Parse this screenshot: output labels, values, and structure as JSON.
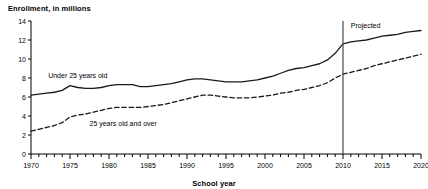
{
  "chart_data": {
    "type": "line",
    "title": "Enrollment, in millions",
    "xlabel": "School year",
    "ylabel": "",
    "xlim": [
      1970,
      2020
    ],
    "ylim": [
      0,
      14
    ],
    "yticks": [
      0,
      2,
      4,
      6,
      8,
      10,
      12,
      14
    ],
    "xticks_major": [
      1970,
      1975,
      1980,
      1985,
      1990,
      1995,
      2000,
      2005,
      2010,
      2015,
      2020
    ],
    "xtick_minor_step": 1,
    "grid": false,
    "legend_position": "inline-annotations",
    "annotations": [
      {
        "name": "projected-divider",
        "type": "vline",
        "x": 2010,
        "label": "Projected",
        "label_x": 2011,
        "label_y": 13.3
      }
    ],
    "series": [
      {
        "name": "Under 25 years old",
        "style": "solid",
        "label_x": 1972.2,
        "label_y": 8.0,
        "x": [
          1970,
          1971,
          1972,
          1973,
          1974,
          1975,
          1976,
          1977,
          1978,
          1979,
          1980,
          1981,
          1982,
          1983,
          1984,
          1985,
          1986,
          1987,
          1988,
          1989,
          1990,
          1991,
          1992,
          1993,
          1994,
          1995,
          1996,
          1997,
          1998,
          1999,
          2000,
          2001,
          2002,
          2003,
          2004,
          2005,
          2006,
          2007,
          2008,
          2009,
          2010,
          2011,
          2012,
          2013,
          2014,
          2015,
          2016,
          2017,
          2018,
          2019,
          2020
        ],
        "y": [
          6.2,
          6.3,
          6.4,
          6.5,
          6.7,
          7.2,
          7.0,
          6.9,
          6.9,
          7.0,
          7.2,
          7.3,
          7.3,
          7.3,
          7.1,
          7.1,
          7.2,
          7.3,
          7.4,
          7.6,
          7.8,
          7.9,
          7.9,
          7.8,
          7.7,
          7.6,
          7.6,
          7.6,
          7.7,
          7.8,
          8.0,
          8.2,
          8.5,
          8.8,
          9.0,
          9.1,
          9.3,
          9.5,
          9.9,
          10.6,
          11.6,
          11.8,
          11.9,
          12.0,
          12.2,
          12.4,
          12.5,
          12.6,
          12.8,
          12.9,
          13.0
        ],
        "final_value": 13.0,
        "start_value": 6.2
      },
      {
        "name": "25 years old and over",
        "style": "dashed",
        "label_x": 1977.5,
        "label_y": 3.0,
        "x": [
          1970,
          1971,
          1972,
          1973,
          1974,
          1975,
          1976,
          1977,
          1978,
          1979,
          1980,
          1981,
          1982,
          1983,
          1984,
          1985,
          1986,
          1987,
          1988,
          1989,
          1990,
          1991,
          1992,
          1993,
          1994,
          1995,
          1996,
          1997,
          1998,
          1999,
          2000,
          2001,
          2002,
          2003,
          2004,
          2005,
          2006,
          2007,
          2008,
          2009,
          2010,
          2011,
          2012,
          2013,
          2014,
          2015,
          2016,
          2017,
          2018,
          2019,
          2020
        ],
        "y": [
          2.4,
          2.6,
          2.8,
          3.0,
          3.3,
          3.9,
          4.1,
          4.2,
          4.4,
          4.6,
          4.8,
          4.9,
          4.9,
          4.9,
          4.9,
          5.0,
          5.1,
          5.2,
          5.4,
          5.6,
          5.8,
          6.0,
          6.2,
          6.2,
          6.1,
          6.0,
          5.9,
          5.9,
          5.9,
          6.0,
          6.1,
          6.2,
          6.4,
          6.5,
          6.7,
          6.8,
          7.0,
          7.2,
          7.5,
          8.0,
          8.4,
          8.6,
          8.8,
          9.0,
          9.3,
          9.5,
          9.7,
          9.9,
          10.1,
          10.3,
          10.5
        ],
        "final_value": 10.5,
        "start_value": 2.4
      }
    ]
  }
}
